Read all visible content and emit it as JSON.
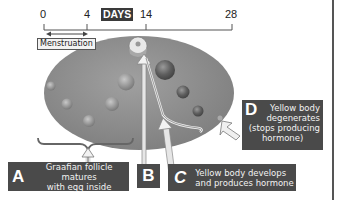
{
  "timeline": {
    "ticks": [
      {
        "label": "0",
        "x": 44
      },
      {
        "label": "4",
        "x": 87
      },
      {
        "label": "14",
        "x": 146
      },
      {
        "label": "28",
        "x": 232
      }
    ],
    "axis_label": "DAYS",
    "range_label": "Menstruation",
    "range": [
      0,
      4
    ]
  },
  "labels": {
    "A": {
      "letter": "A",
      "text_line1": "Graafian follicle matures",
      "text_line2": "with egg inside"
    },
    "B": {
      "letter": "B"
    },
    "C": {
      "letter": "C",
      "text_line1": "Yellow body develops",
      "text_line2": "and produces hormone"
    },
    "D": {
      "letter": "D",
      "text_line1": "Yellow body",
      "text_line2": "degenerates",
      "text_line3": "(stops producing",
      "text_line4": "hormone)"
    }
  },
  "colors": {
    "ovary": "#8c8c8c",
    "label_bg": "#4a4a4a",
    "follicle": "#6a6a6a"
  }
}
